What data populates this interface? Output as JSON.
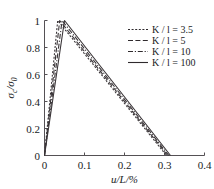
{
  "chart_data": {
    "type": "line",
    "title": "",
    "subtitle": "",
    "xlabel": "u/L/%",
    "ylabel": "σc/σ0",
    "xlim": [
      0,
      0.4
    ],
    "ylim": [
      0,
      1
    ],
    "grid": false,
    "legend_position": "top-right",
    "xticks": [
      "0",
      "0.1",
      "0.2",
      "0.3",
      "0.4"
    ],
    "xtick_values": [
      0,
      0.1,
      0.2,
      0.3,
      0.4
    ],
    "yticks": [
      "0",
      "0.2",
      "0.4",
      "0.6",
      "0.8",
      "1"
    ],
    "ytick_values": [
      0,
      0.2,
      0.4,
      0.6,
      0.8,
      1
    ],
    "series": [
      {
        "name": "K/l = 3.5",
        "label_prefix": "K",
        "label_mid": "/",
        "label_var": "l",
        "label_value": "3.5",
        "dash": "2,1.6",
        "color": "#2f2a2d",
        "x": [
          0,
          0.033,
          0.305
        ],
        "y": [
          0,
          1.0,
          0
        ]
      },
      {
        "name": "K/l = 5",
        "label_prefix": "K",
        "label_mid": "/",
        "label_var": "l",
        "label_value": "5",
        "dash": "5,2.4",
        "color": "#2f2a2d",
        "x": [
          0,
          0.038,
          0.308
        ],
        "y": [
          0,
          1.0,
          0
        ]
      },
      {
        "name": "K/l = 10",
        "label_prefix": "K",
        "label_mid": "/",
        "label_var": "l",
        "label_value": "10",
        "dash": "5,1.8,1.2,1.8",
        "color": "#2f2a2d",
        "x": [
          0,
          0.044,
          0.311
        ],
        "y": [
          0,
          1.0,
          0
        ]
      },
      {
        "name": "K/l = 100",
        "label_prefix": "K",
        "label_mid": "/",
        "label_var": "l",
        "label_value": "100",
        "dash": "none",
        "color": "#2f2a2d",
        "x": [
          0,
          0.05,
          0.315
        ],
        "y": [
          0,
          1.0,
          0
        ]
      }
    ]
  },
  "axes": {
    "y_title_numerator": "σ",
    "y_title_numerator_sub": "c",
    "y_title_slash": "/",
    "y_title_denominator": "σ",
    "y_title_denominator_sub": "0",
    "x_title": "u/L/%"
  },
  "legend": {
    "entries": [
      {
        "label": "K / l = 3.5"
      },
      {
        "label": "K / l = 5"
      },
      {
        "label": "K / l = 10"
      },
      {
        "label": "K / l = 100"
      }
    ]
  }
}
